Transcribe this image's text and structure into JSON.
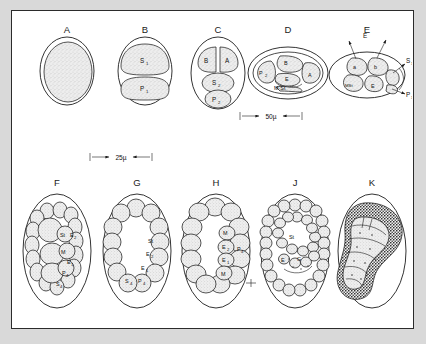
{
  "figure": {
    "background_color": "#d9d9d9",
    "plate_background": "#ffffff",
    "border_color": "#2b2b2b",
    "ink_color": "#1d1d1d",
    "stipple_fill": "#e9e9e9"
  },
  "scale_bars": [
    {
      "id": "scale-50",
      "label": "50µ",
      "row": "top"
    },
    {
      "id": "scale-25",
      "label": "25µ",
      "row": "bottom"
    }
  ],
  "top_row": {
    "panels": [
      {
        "letter": "A",
        "description": "uncleaved egg within vitelline membrane",
        "cells": []
      },
      {
        "letter": "B",
        "description": "two-cell stage",
        "cells": [
          {
            "label": "S",
            "sub": "1"
          },
          {
            "label": "P",
            "sub": "1"
          }
        ]
      },
      {
        "letter": "C",
        "description": "four-cell stage",
        "cells": [
          {
            "label": "B",
            "sub": ""
          },
          {
            "label": "A",
            "sub": ""
          },
          {
            "label": "S",
            "sub": "2"
          },
          {
            "label": "P",
            "sub": "2"
          }
        ]
      },
      {
        "letter": "D",
        "description": "five-cell stage, horizontal orientation",
        "cells": [
          {
            "label": "P",
            "sub": "2"
          },
          {
            "label": "B",
            "sub": ""
          },
          {
            "label": "E",
            "sub": ""
          },
          {
            "label": "A",
            "sub": ""
          },
          {
            "label": "M·St",
            "sub": ""
          }
        ]
      },
      {
        "letter": "E",
        "description": "later stage with daughter cell arrows",
        "cells": [
          {
            "label": "a",
            "sub": ""
          },
          {
            "label": "b",
            "sub": ""
          },
          {
            "label": "MSt",
            "sub": ""
          },
          {
            "label": "E",
            "sub": ""
          }
        ],
        "arrow_labels": [
          {
            "text": "E",
            "sub": ""
          },
          {
            "text": "S",
            "sub": "3"
          },
          {
            "text": "P",
            "sub": "3"
          }
        ]
      }
    ]
  },
  "bottom_row": {
    "panels": [
      {
        "letter": "F",
        "description": "morula with inner cell mass",
        "cells": [
          {
            "label": "St",
            "sub": ""
          },
          {
            "label": "E",
            "sub": "2"
          },
          {
            "label": "M",
            "sub": ""
          },
          {
            "label": "E",
            "sub": "1"
          },
          {
            "label": "P",
            "sub": "4"
          },
          {
            "label": "S",
            "sub": "4"
          }
        ]
      },
      {
        "letter": "G",
        "description": "blastula ring of cells",
        "cells": [
          {
            "label": "St",
            "sub": ""
          },
          {
            "label": "E",
            "sub": "2"
          },
          {
            "label": "E",
            "sub": "1"
          },
          {
            "label": "S",
            "sub": "4"
          },
          {
            "label": "P",
            "sub": "4"
          }
        ]
      },
      {
        "letter": "H",
        "description": "gastrula with inner cells",
        "cells": [
          {
            "label": "M",
            "sub": ""
          },
          {
            "label": "E",
            "sub": "2"
          },
          {
            "label": "E",
            "sub": "1"
          },
          {
            "label": "M",
            "sub": ""
          },
          {
            "label": "P",
            "sub": "4"
          }
        ]
      },
      {
        "letter": "J",
        "description": "elongating embryo with gut rudiment",
        "cells": [
          {
            "label": "St",
            "sub": ""
          },
          {
            "label": "E",
            "sub": ""
          },
          {
            "label": "G",
            "sub": ""
          }
        ]
      },
      {
        "letter": "K",
        "description": "comma stage embryo",
        "cells": []
      }
    ]
  }
}
